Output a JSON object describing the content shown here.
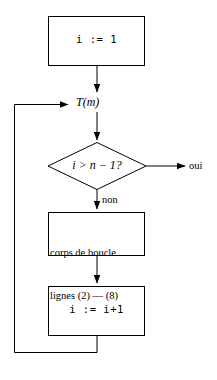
{
  "diagram": {
    "type": "flowchart",
    "background_color": "#ffffff",
    "stroke_color": "#000000",
    "stroke_width": 1,
    "nodes": [
      {
        "id": "init",
        "shape": "rectangle",
        "text": "i := 1",
        "font": "monospace",
        "x": 48,
        "y": 16,
        "width": 97,
        "height": 50
      },
      {
        "id": "loop-entry",
        "shape": "label",
        "text": "T(m)",
        "font": "math-italic",
        "x": 76,
        "y": 96
      },
      {
        "id": "condition",
        "shape": "diamond",
        "text": "i > n − 1?",
        "font": "math-italic",
        "cx": 97,
        "cy": 166,
        "rx": 49,
        "ry": 24
      },
      {
        "id": "body",
        "shape": "rectangle",
        "line1": "corps de boucle",
        "line2": "lignes (2) — (8)",
        "font": "serif",
        "x": 48,
        "y": 212,
        "width": 97,
        "height": 44
      },
      {
        "id": "increment",
        "shape": "rectangle",
        "text": "i := i+1",
        "font": "monospace",
        "x": 48,
        "y": 286,
        "width": 97,
        "height": 50
      }
    ],
    "edge_labels": {
      "yes": "oui",
      "no": "non"
    }
  }
}
